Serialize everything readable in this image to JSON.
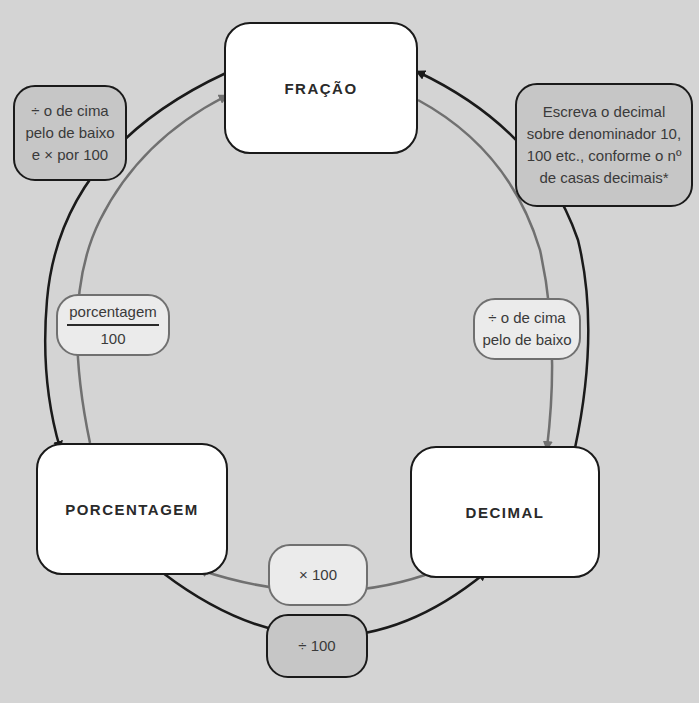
{
  "nodes": {
    "fraction": "FRAÇÃO",
    "percentage": "PORCENTAGEM",
    "decimal": "DECIMAL"
  },
  "labels": {
    "fraction_to_percentage": [
      "÷ o de cima",
      "pelo de baixo",
      "e × por 100"
    ],
    "decimal_to_fraction": [
      "Escreva o decimal",
      "sobre denominador 10,",
      "100 etc., conforme o nº",
      "de casas decimais*"
    ],
    "percentage_to_fraction": {
      "numerator": "porcentagem",
      "denominator": "100"
    },
    "fraction_to_decimal": [
      "÷ o de cima",
      "pelo de baixo"
    ],
    "decimal_to_percentage": "× 100",
    "percentage_to_decimal": "÷ 100"
  },
  "colors": {
    "background": "#d4d4d4",
    "outer_arrow": "#1a1a1a",
    "inner_arrow": "#707070",
    "dark_label_fill": "#c6c6c6",
    "light_label_fill": "#ebebeb",
    "node_fill": "#ffffff"
  }
}
